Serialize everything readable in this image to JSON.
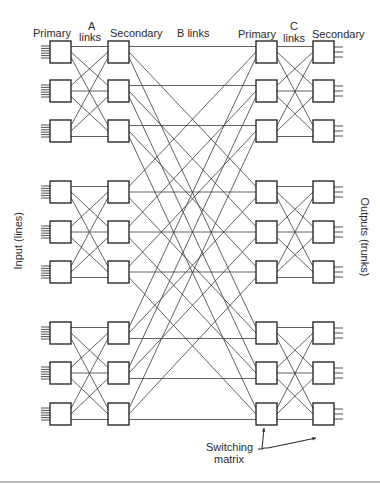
{
  "labels": {
    "primary_left": "Primary",
    "a_links_1": "A",
    "a_links_2": "links",
    "secondary_left": "Secondary",
    "b_links": "B links",
    "primary_right": "Primary",
    "c_links_1": "C",
    "c_links_2": "links",
    "secondary_right": "Secondary",
    "input": "Input (lines)",
    "outputs": "Outputs (trunks)",
    "switching_1": "Switching",
    "switching_2": "matrix"
  },
  "diagram": {
    "columns": {
      "primary_in_x": 50,
      "secondary_in_x": 108,
      "primary_out_x": 256,
      "secondary_out_x": 313,
      "box_w": 21,
      "box_h": 22
    },
    "rows_top": [
      41,
      80,
      120,
      181,
      221,
      261,
      322,
      362,
      403
    ],
    "groups": 3,
    "boxes_per_group": 3,
    "input_lines_per_box": 6,
    "output_lines_per_box": 3,
    "stroke_color": "#2a2a2a",
    "line_color": "#3a3a3a"
  }
}
